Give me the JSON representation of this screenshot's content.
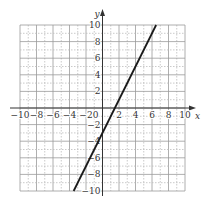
{
  "chart_data": {
    "type": "line",
    "title": "",
    "xlabel": "x",
    "ylabel": "y",
    "xlim": [
      -10,
      10
    ],
    "ylim": [
      -10,
      10
    ],
    "grid": true,
    "x_ticks": [
      -10,
      -8,
      -6,
      -4,
      -2,
      0,
      2,
      4,
      6,
      8,
      10
    ],
    "y_ticks": [
      -10,
      -8,
      -6,
      -4,
      -2,
      2,
      4,
      6,
      8,
      10
    ],
    "x_tick_labels": [
      "−10",
      "−8",
      "−6",
      "−4",
      "−2",
      "0",
      "2",
      "4",
      "6",
      "8",
      "10"
    ],
    "y_tick_labels": [
      "−10",
      "−8",
      "−6",
      "−4",
      "−2",
      "2",
      "4",
      "6",
      "8",
      "10"
    ],
    "series": [
      {
        "name": "y = 2x − 3",
        "equation": "y = 2x - 3",
        "x": [
          -3.5,
          6.5
        ],
        "y": [
          -10,
          10
        ],
        "color": "#1a1a1a"
      }
    ]
  }
}
